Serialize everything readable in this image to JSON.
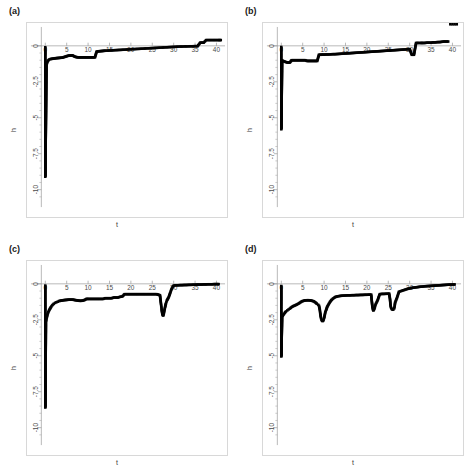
{
  "figure": {
    "background": "#ffffff",
    "panel_frame_color": "#d8d8d8",
    "axis_color": "#9a9a9a",
    "data_color": "#000000"
  },
  "panels": [
    {
      "id": "a",
      "label": "(a)"
    },
    {
      "id": "b",
      "label": "(b)"
    },
    {
      "id": "c",
      "label": "(c)"
    },
    {
      "id": "d",
      "label": "(d)"
    }
  ],
  "axes": {
    "xlabel": "t",
    "ylabel": "h",
    "xticks": [
      0,
      5,
      10,
      15,
      20,
      25,
      30,
      35,
      40
    ],
    "xticklabels": [
      "0",
      "5",
      "10",
      "15",
      "20",
      "25",
      "30",
      "35",
      "40"
    ],
    "yticks": [
      0,
      -2.5,
      -5,
      -7.5,
      -10
    ],
    "yticklabels": [
      "0",
      "-2.5",
      "-5",
      "-7.5",
      "-10"
    ],
    "xlim": [
      -1.5,
      42
    ],
    "ylim": [
      -10.8,
      0.9
    ],
    "grid": false,
    "zero_line": true
  },
  "chart_data": [
    {
      "type": "scatter",
      "panel": "a",
      "title": "(a)",
      "xlabel": "t",
      "ylabel": "h",
      "xlim": [
        -1.5,
        42
      ],
      "ylim": [
        -10.8,
        0.9
      ],
      "grid": false,
      "series": [
        {
          "name": "h(t)",
          "x": [
            0.0,
            0.0,
            0.0,
            0.0,
            0.0,
            0.0,
            0.0,
            0.0,
            0.0,
            0.0,
            0.0,
            0.0,
            0.0,
            0.0,
            0.0,
            0.0,
            0.0,
            0.0,
            0.0,
            0.0,
            0.0,
            0.0,
            0.3,
            0.6,
            0.9,
            1.2,
            1.6,
            2.0,
            2.4,
            2.8,
            3.2,
            3.6,
            4.0,
            4.4,
            4.8,
            5.2,
            5.6,
            6.0,
            6.4,
            6.8,
            7.2,
            7.6,
            8.0,
            8.4,
            8.8,
            9.2,
            9.6,
            10.0,
            10.4,
            10.8,
            11.2,
            11.6,
            12.0,
            12.4,
            12.8,
            13.2,
            13.6,
            14.0,
            14.6,
            15.2,
            15.8,
            16.4,
            17.0,
            17.6,
            18.2,
            18.8,
            19.4,
            20.0,
            20.6,
            21.2,
            21.8,
            22.4,
            23.0,
            23.6,
            24.2,
            24.8,
            25.4,
            26.0,
            26.6,
            27.2,
            27.8,
            28.4,
            29.0,
            29.6,
            30.2,
            30.8,
            31.4,
            32.0,
            32.6,
            33.2,
            33.8,
            34.4,
            35.0,
            35.6,
            36.2,
            36.6,
            37.0,
            37.6,
            38.2,
            38.8,
            39.4,
            40.0,
            40.6,
            41.0
          ],
          "y": [
            -0.1,
            -0.35,
            -0.62,
            -0.95,
            -1.3,
            -1.55,
            -1.72,
            -1.88,
            -2.05,
            -2.3,
            -2.62,
            -3.0,
            -3.4,
            -3.85,
            -4.35,
            -4.9,
            -5.45,
            -6.05,
            -6.7,
            -7.4,
            -8.2,
            -9.1,
            -1.28,
            -1.05,
            -0.95,
            -0.92,
            -0.9,
            -0.88,
            -0.86,
            -0.85,
            -0.84,
            -0.83,
            -0.82,
            -0.78,
            -0.74,
            -0.7,
            -0.68,
            -0.67,
            -0.67,
            -0.74,
            -0.78,
            -0.8,
            -0.8,
            -0.8,
            -0.8,
            -0.8,
            -0.8,
            -0.8,
            -0.8,
            -0.8,
            -0.8,
            -0.8,
            -0.4,
            -0.38,
            -0.37,
            -0.36,
            -0.35,
            -0.34,
            -0.33,
            -0.32,
            -0.31,
            -0.3,
            -0.29,
            -0.28,
            -0.27,
            -0.26,
            -0.25,
            -0.24,
            -0.23,
            -0.22,
            -0.21,
            -0.2,
            -0.19,
            -0.18,
            -0.17,
            -0.16,
            -0.15,
            -0.14,
            -0.13,
            -0.12,
            -0.11,
            -0.1,
            -0.09,
            -0.08,
            -0.07,
            -0.06,
            -0.05,
            -0.05,
            -0.04,
            -0.04,
            -0.03,
            -0.03,
            -0.02,
            -0.02,
            0.22,
            0.22,
            0.22,
            0.4,
            0.4,
            0.4,
            0.4,
            0.4,
            0.4,
            0.4
          ]
        }
      ]
    },
    {
      "type": "scatter",
      "panel": "b",
      "title": "(b)",
      "xlabel": "t",
      "ylabel": "h",
      "xlim": [
        -1.5,
        42
      ],
      "ylim": [
        -10.8,
        0.9
      ],
      "grid": false,
      "series": [
        {
          "name": "h(t)",
          "x": [
            0.0,
            0.0,
            0.0,
            0.0,
            0.0,
            0.0,
            0.0,
            0.0,
            0.0,
            0.0,
            0.0,
            0.0,
            0.0,
            0.0,
            0.0,
            0.0,
            0.0,
            0.0,
            0.0,
            0.0,
            0.2,
            0.4,
            0.6,
            0.8,
            1.0,
            1.2,
            1.4,
            1.6,
            1.8,
            2.0,
            2.4,
            2.8,
            3.2,
            3.6,
            4.0,
            4.4,
            4.8,
            5.2,
            5.6,
            6.0,
            6.4,
            6.8,
            7.2,
            7.6,
            8.0,
            8.4,
            8.8,
            9.2,
            9.6,
            10.0,
            10.5,
            11.0,
            11.5,
            12.0,
            12.5,
            13.0,
            13.5,
            14.0,
            14.5,
            15.0,
            15.5,
            16.0,
            16.5,
            17.0,
            17.5,
            18.0,
            18.5,
            19.0,
            19.5,
            20.0,
            20.5,
            21.0,
            21.5,
            22.0,
            22.5,
            23.0,
            23.5,
            24.0,
            24.5,
            25.0,
            25.5,
            26.0,
            26.5,
            27.0,
            27.5,
            28.0,
            28.5,
            29.0,
            29.5,
            30.0,
            30.5,
            31.0,
            31.5,
            32.0,
            32.3,
            32.6,
            33.0,
            33.5,
            34.0,
            34.5,
            35.0,
            35.5,
            36.0,
            36.5,
            37.0,
            37.5,
            38.0,
            38.5,
            39.0,
            39.5,
            40.0,
            40.5,
            41.0
          ],
          "y": [
            -0.08,
            -0.3,
            -0.55,
            -0.8,
            -1.05,
            -1.2,
            -1.35,
            -1.55,
            -1.8,
            -2.05,
            -2.3,
            -2.55,
            -2.85,
            -3.15,
            -3.5,
            -3.9,
            -4.3,
            -4.75,
            -5.25,
            -5.8,
            -1.0,
            -1.05,
            -1.08,
            -1.1,
            -1.12,
            -1.14,
            -1.15,
            -1.16,
            -1.16,
            -1.16,
            -1.0,
            -1.0,
            -1.0,
            -1.0,
            -1.0,
            -1.0,
            -1.0,
            -1.0,
            -1.0,
            -1.05,
            -1.05,
            -1.05,
            -1.05,
            -1.05,
            -1.05,
            -1.05,
            -0.62,
            -0.62,
            -0.61,
            -0.61,
            -0.6,
            -0.6,
            -0.59,
            -0.58,
            -0.58,
            -0.57,
            -0.56,
            -0.55,
            -0.54,
            -0.53,
            -0.52,
            -0.51,
            -0.5,
            -0.49,
            -0.48,
            -0.47,
            -0.46,
            -0.45,
            -0.44,
            -0.43,
            -0.42,
            -0.41,
            -0.4,
            -0.39,
            -0.38,
            -0.37,
            -0.36,
            -0.35,
            -0.34,
            -0.33,
            -0.32,
            -0.31,
            -0.3,
            -0.29,
            -0.28,
            -0.27,
            -0.26,
            -0.25,
            -0.24,
            -0.23,
            -0.62,
            -0.62,
            0.2,
            0.2,
            0.2,
            0.2,
            0.2,
            0.2,
            0.22,
            0.22,
            0.22,
            0.24,
            0.24,
            0.26,
            0.26,
            0.28,
            0.3,
            0.3,
            0.3
          ]
        }
      ]
    },
    {
      "type": "scatter",
      "panel": "c",
      "title": "(c)",
      "xlabel": "t",
      "ylabel": "h",
      "xlim": [
        -1.5,
        42
      ],
      "ylim": [
        -10.8,
        0.9
      ],
      "grid": false,
      "series": [
        {
          "name": "h(t)",
          "x": [
            0.0,
            0.0,
            0.0,
            0.0,
            0.0,
            0.0,
            0.0,
            0.0,
            0.0,
            0.0,
            0.0,
            0.0,
            0.0,
            0.0,
            0.0,
            0.0,
            0.0,
            0.0,
            0.0,
            0.0,
            0.0,
            0.0,
            0.0,
            0.15,
            0.3,
            0.45,
            0.6,
            0.8,
            1.0,
            1.2,
            1.4,
            1.6,
            1.8,
            2.0,
            2.3,
            2.6,
            2.9,
            3.2,
            3.6,
            4.0,
            4.4,
            4.8,
            5.2,
            5.6,
            6.0,
            6.4,
            6.8,
            7.2,
            7.6,
            8.0,
            8.4,
            8.8,
            9.2,
            9.6,
            10.0,
            10.5,
            11.0,
            11.5,
            12.0,
            12.5,
            13.0,
            13.5,
            14.0,
            14.5,
            15.0,
            15.5,
            16.0,
            16.5,
            17.0,
            17.5,
            18.0,
            18.5,
            19.0,
            19.5,
            20.0,
            20.5,
            21.0,
            21.5,
            22.0,
            22.5,
            23.0,
            23.5,
            24.0,
            24.5,
            25.0,
            25.5,
            26.0,
            26.4,
            26.8,
            27.0,
            27.1,
            27.2,
            27.3,
            27.4,
            27.5,
            27.6,
            27.7,
            27.8,
            27.9,
            28.0,
            28.1,
            28.2,
            28.3,
            28.4,
            28.6,
            28.8,
            29.0,
            29.2,
            29.4,
            29.6,
            30.0,
            30.5,
            31.0,
            31.5,
            32.0,
            32.5,
            33.0,
            33.5,
            34.0,
            34.5,
            35.0,
            35.5,
            36.0,
            36.5,
            37.0,
            37.5,
            38.0,
            38.5,
            39.0,
            39.5,
            40.0,
            40.5
          ],
          "y": [
            -0.12,
            -0.4,
            -0.7,
            -1.0,
            -1.3,
            -1.58,
            -1.85,
            -2.1,
            -2.35,
            -2.6,
            -2.9,
            -3.2,
            -3.55,
            -3.9,
            -4.2,
            -4.5,
            -4.8,
            -5.05,
            -5.3,
            -5.6,
            -6.2,
            -7.2,
            -8.6,
            -2.65,
            -2.4,
            -2.2,
            -2.05,
            -1.9,
            -1.78,
            -1.68,
            -1.58,
            -1.5,
            -1.44,
            -1.38,
            -1.32,
            -1.28,
            -1.24,
            -1.2,
            -1.17,
            -1.15,
            -1.13,
            -1.12,
            -1.11,
            -1.1,
            -1.1,
            -1.1,
            -1.12,
            -1.14,
            -1.16,
            -1.18,
            -1.18,
            -1.16,
            -1.12,
            -1.05,
            -1.05,
            -1.05,
            -1.05,
            -1.05,
            -1.05,
            -1.05,
            -1.05,
            -1.05,
            -1.0,
            -1.0,
            -1.0,
            -1.0,
            -0.95,
            -0.95,
            -0.95,
            -0.9,
            -0.88,
            -0.72,
            -0.72,
            -0.72,
            -0.72,
            -0.72,
            -0.72,
            -0.72,
            -0.72,
            -0.72,
            -0.72,
            -0.72,
            -0.72,
            -0.72,
            -0.72,
            -0.72,
            -0.72,
            -0.75,
            -0.8,
            -1.3,
            -1.55,
            -1.8,
            -2.0,
            -2.15,
            -2.2,
            -2.18,
            -2.05,
            -1.9,
            -1.75,
            -1.6,
            -1.48,
            -1.36,
            -1.26,
            -1.16,
            -1.06,
            -0.95,
            -0.8,
            -0.62,
            -0.45,
            -0.3,
            -0.12,
            -0.1,
            -0.1,
            -0.09,
            -0.09,
            -0.08,
            -0.08,
            -0.07,
            -0.07,
            -0.06,
            -0.06,
            -0.05,
            -0.05,
            -0.05,
            -0.04,
            -0.04,
            -0.03,
            -0.03,
            -0.03,
            -0.02,
            -0.02,
            -0.02,
            -0.02,
            -0.02
          ]
        }
      ]
    },
    {
      "type": "scatter",
      "panel": "d",
      "title": "(d)",
      "xlabel": "t",
      "ylabel": "h",
      "xlim": [
        -1.5,
        42
      ],
      "ylim": [
        -10.8,
        0.9
      ],
      "grid": false,
      "series": [
        {
          "name": "h(t)",
          "x": [
            0.0,
            0.0,
            0.0,
            0.0,
            0.0,
            0.0,
            0.0,
            0.0,
            0.0,
            0.0,
            0.0,
            0.0,
            0.0,
            0.0,
            0.0,
            0.0,
            0.0,
            0.0,
            0.2,
            0.5,
            0.8,
            1.1,
            1.4,
            1.7,
            2.0,
            2.4,
            2.8,
            3.2,
            3.6,
            4.0,
            4.4,
            4.8,
            5.2,
            5.6,
            6.0,
            6.4,
            6.8,
            7.2,
            7.6,
            8.0,
            8.3,
            8.6,
            8.8,
            9.0,
            9.1,
            9.2,
            9.3,
            9.4,
            9.5,
            9.6,
            9.7,
            9.8,
            9.9,
            10.0,
            10.1,
            10.2,
            10.3,
            10.5,
            10.7,
            11.0,
            11.4,
            11.8,
            12.2,
            12.6,
            13.0,
            13.5,
            14.0,
            14.5,
            15.0,
            15.5,
            16.0,
            16.5,
            17.0,
            17.5,
            18.0,
            18.5,
            19.0,
            19.5,
            20.0,
            20.5,
            21.0,
            21.1,
            21.2,
            21.3,
            21.4,
            21.5,
            21.6,
            21.8,
            22.0,
            22.5,
            23.0,
            23.5,
            24.0,
            24.5,
            25.0,
            25.2,
            25.4,
            25.5,
            25.6,
            25.8,
            26.0,
            26.2,
            26.4,
            26.5,
            26.6,
            27.0,
            27.5,
            28.0,
            28.5,
            29.0,
            29.5,
            30.0,
            30.5,
            31.0,
            31.5,
            32.0,
            32.5,
            33.0,
            33.5,
            34.0,
            34.5,
            35.0,
            35.5,
            36.0,
            36.5,
            37.0,
            37.5,
            38.0,
            38.5,
            39.0,
            39.5,
            40.0,
            40.5
          ],
          "y": [
            -0.15,
            -0.45,
            -0.8,
            -1.15,
            -1.45,
            -1.7,
            -1.95,
            -2.15,
            -2.35,
            -2.55,
            -2.8,
            -3.1,
            -3.45,
            -3.85,
            -4.25,
            -4.6,
            -4.85,
            -5.05,
            -2.3,
            -2.15,
            -2.02,
            -1.92,
            -1.85,
            -1.78,
            -1.72,
            -1.62,
            -1.55,
            -1.5,
            -1.44,
            -1.38,
            -1.3,
            -1.22,
            -1.18,
            -1.15,
            -1.14,
            -1.14,
            -1.15,
            -1.18,
            -1.22,
            -1.3,
            -1.38,
            -1.45,
            -1.52,
            -1.8,
            -2.05,
            -2.25,
            -2.4,
            -2.5,
            -2.55,
            -2.58,
            -2.58,
            -2.55,
            -2.48,
            -2.38,
            -2.25,
            -2.1,
            -1.95,
            -1.8,
            -1.62,
            -1.45,
            -1.25,
            -1.1,
            -1.0,
            -0.92,
            -0.88,
            -0.85,
            -0.83,
            -0.82,
            -0.81,
            -0.8,
            -0.8,
            -0.79,
            -0.79,
            -0.78,
            -0.78,
            -0.77,
            -0.77,
            -0.76,
            -0.76,
            -0.75,
            -0.75,
            -1.05,
            -1.35,
            -1.62,
            -1.78,
            -1.85,
            -1.82,
            -1.7,
            -1.45,
            -1.15,
            -0.72,
            -0.7,
            -0.7,
            -0.69,
            -0.69,
            -0.68,
            -1.05,
            -1.4,
            -1.62,
            -1.75,
            -1.8,
            -1.78,
            -1.7,
            -1.52,
            -1.3,
            -1.0,
            -0.55,
            -0.5,
            -0.45,
            -0.4,
            -0.35,
            -0.32,
            -0.28,
            -0.26,
            -0.24,
            -0.22,
            -0.2,
            -0.19,
            -0.17,
            -0.16,
            -0.15,
            -0.14,
            -0.13,
            -0.12,
            -0.11,
            -0.1,
            -0.09,
            -0.08,
            -0.07,
            -0.06,
            -0.05,
            -0.05,
            -0.04,
            -0.04
          ]
        }
      ]
    }
  ]
}
